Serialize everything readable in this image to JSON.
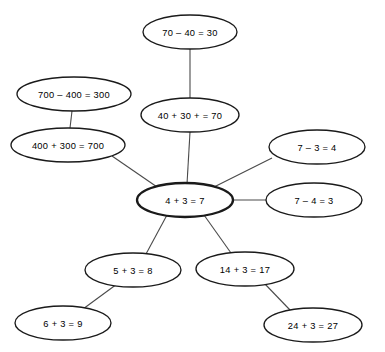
{
  "diagram": {
    "background_color": "#ffffff",
    "node_stroke_color": "#1a1a1a",
    "edge_stroke_color": "#4a4a4a",
    "text_color": "#000000",
    "nodes": [
      {
        "id": "n0",
        "label": "70 – 40 = 30",
        "cx": 190,
        "cy": 32,
        "rx": 47,
        "ry": 17,
        "hub": false
      },
      {
        "id": "n1",
        "label": "700 – 400 = 300",
        "cx": 74,
        "cy": 94,
        "rx": 57,
        "ry": 17,
        "hub": false
      },
      {
        "id": "n2",
        "label": "40 + 30 + = 70",
        "cx": 190,
        "cy": 115,
        "rx": 49,
        "ry": 17,
        "hub": false
      },
      {
        "id": "n3",
        "label": "400 + 300 = 700",
        "cx": 68,
        "cy": 145,
        "rx": 57,
        "ry": 17,
        "hub": false
      },
      {
        "id": "n4",
        "label": "7 – 3 = 4",
        "cx": 317,
        "cy": 147,
        "rx": 48,
        "ry": 17,
        "hub": false
      },
      {
        "id": "n5",
        "label": "4 + 3 = 7",
        "cx": 185,
        "cy": 200,
        "rx": 48,
        "ry": 17,
        "hub": true
      },
      {
        "id": "n6",
        "label": "7 – 4 = 3",
        "cx": 314,
        "cy": 200,
        "rx": 48,
        "ry": 17,
        "hub": false
      },
      {
        "id": "n7",
        "label": "5 + 3 = 8",
        "cx": 133,
        "cy": 270,
        "rx": 48,
        "ry": 17,
        "hub": false
      },
      {
        "id": "n8",
        "label": "14 + 3 = 17",
        "cx": 245,
        "cy": 269,
        "rx": 49,
        "ry": 17,
        "hub": false
      },
      {
        "id": "n9",
        "label": "6 + 3 = 9",
        "cx": 63,
        "cy": 323,
        "rx": 48,
        "ry": 17,
        "hub": false
      },
      {
        "id": "n10",
        "label": "24 + 3 = 27",
        "cx": 313,
        "cy": 325,
        "rx": 49,
        "ry": 17,
        "hub": false
      }
    ],
    "edges": [
      {
        "id": "e0",
        "from": "n0",
        "to": "n2",
        "x1": 190,
        "y1": 49,
        "x2": 190,
        "y2": 98
      },
      {
        "id": "e1",
        "from": "n1",
        "to": "n3",
        "x1": 72,
        "y1": 111,
        "x2": 70,
        "y2": 128
      },
      {
        "id": "e2",
        "from": "n2",
        "to": "n5",
        "x1": 190,
        "y1": 132,
        "x2": 187,
        "y2": 184
      },
      {
        "id": "e3",
        "from": "n3",
        "to": "n5",
        "x1": 112,
        "y1": 156,
        "x2": 160,
        "y2": 189
      },
      {
        "id": "e4",
        "from": "n4",
        "to": "n5",
        "x1": 272,
        "y1": 158,
        "x2": 210,
        "y2": 189
      },
      {
        "id": "e5",
        "from": "n5",
        "to": "n6",
        "x1": 233,
        "y1": 200,
        "x2": 266,
        "y2": 200
      },
      {
        "id": "e6",
        "from": "n5",
        "to": "n7",
        "x1": 167,
        "y1": 215,
        "x2": 146,
        "y2": 254
      },
      {
        "id": "e7",
        "from": "n5",
        "to": "n8",
        "x1": 204,
        "y1": 215,
        "x2": 231,
        "y2": 253
      },
      {
        "id": "e8",
        "from": "n7",
        "to": "n9",
        "x1": 117,
        "y1": 284,
        "x2": 83,
        "y2": 309
      },
      {
        "id": "e9",
        "from": "n8",
        "to": "n10",
        "x1": 264,
        "y1": 283,
        "x2": 290,
        "y2": 310
      }
    ]
  }
}
